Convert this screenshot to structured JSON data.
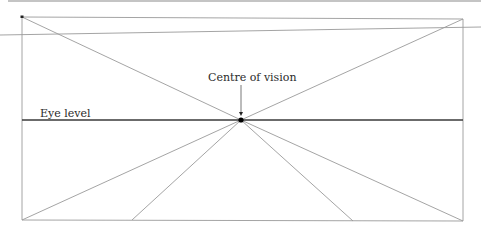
{
  "diagram": {
    "labels": {
      "centre_of_vision": "Centre of vision",
      "eye_level": "Eye level"
    },
    "colors": {
      "line": "#9a9a9a",
      "eye_level_line": "#3a3a3a",
      "point": "#000000",
      "text": "#2a2a2a",
      "top_rule": "#7a7a7a"
    },
    "centre_point": {
      "x": 241,
      "y": 120
    },
    "frame": {
      "top_left": {
        "x": 22,
        "y": 17
      },
      "top_right": {
        "x": 463,
        "y": 19
      },
      "bottom_left": {
        "x": 22,
        "y": 220
      },
      "bottom_right": {
        "x": 463,
        "y": 221
      }
    },
    "ground_points": [
      {
        "x": 22,
        "y": 220
      },
      {
        "x": 132,
        "y": 220
      },
      {
        "x": 353,
        "y": 221
      },
      {
        "x": 463,
        "y": 221
      }
    ]
  }
}
